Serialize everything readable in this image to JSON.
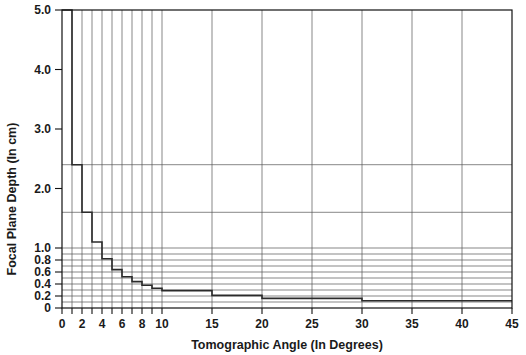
{
  "chart_data": {
    "type": "line",
    "title": "",
    "xlabel": "Tomographic Angle (In Degrees)",
    "ylabel": "Focal Plane Depth (In cm)",
    "xlim": [
      0,
      45
    ],
    "ylim": [
      0,
      5.0
    ],
    "grid": true,
    "legend": "none",
    "y_scale": "piecewise-linear",
    "x_ticks": [
      0,
      1,
      2,
      3,
      4,
      5,
      6,
      7,
      8,
      9,
      10,
      15,
      20,
      25,
      30,
      35,
      40,
      45
    ],
    "x_tick_labels": [
      "0",
      "",
      "2",
      "",
      "4",
      "",
      "6",
      "",
      "8",
      "",
      "10",
      "15",
      "20",
      "25",
      "30",
      "35",
      "40",
      "45"
    ],
    "y_ticks": [
      0,
      0.2,
      0.4,
      0.6,
      0.8,
      1.0,
      2.0,
      3.0,
      4.0,
      5.0
    ],
    "y_tick_labels": [
      "0",
      "0.2",
      "0.4",
      "0.6",
      "0.8",
      "1.0",
      "2.0",
      "3.0",
      "4.0",
      "5.0"
    ],
    "series": [
      {
        "name": "Focal plane depth vs tomographic angle",
        "style": "step-post",
        "x": [
          0,
          1,
          2,
          3,
          4,
          5,
          6,
          7,
          8,
          9,
          10,
          15,
          20,
          30,
          45
        ],
        "values": [
          5.0,
          2.4,
          1.6,
          1.1,
          0.82,
          0.64,
          0.52,
          0.44,
          0.38,
          0.33,
          0.29,
          0.21,
          0.16,
          0.12,
          0.12
        ]
      }
    ],
    "gridline_y_values": [
      0.1,
      0.2,
      0.3,
      0.4,
      0.5,
      0.6,
      0.7,
      0.8,
      0.9,
      1.0,
      1.6,
      2.4
    ],
    "gridline_x_values": [
      1,
      2,
      3,
      4,
      5,
      6,
      7,
      8,
      9,
      10,
      15,
      20,
      25,
      30,
      35,
      40
    ]
  },
  "colors": {
    "axis": "#111111",
    "curve": "#2b2b2b",
    "grid": "#555555",
    "background": "#ffffff"
  }
}
